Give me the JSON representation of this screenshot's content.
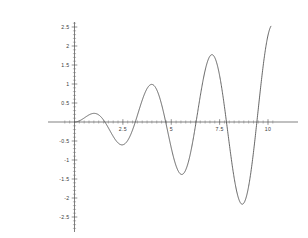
{
  "chart_data": {
    "type": "line",
    "title": "",
    "subtitle": "",
    "xlabel": "",
    "ylabel": "",
    "xlim": [
      -0.72,
      10.3
    ],
    "ylim": [
      -2.82,
      2.78
    ],
    "grid": false,
    "legend": false,
    "legend_position": "none",
    "axis_style": "centered-cross",
    "x_ticks_major": [
      2.5,
      5,
      7.5,
      10
    ],
    "x_tick_labels": [
      "2.5",
      "5",
      "7.5",
      "10"
    ],
    "y_ticks_major": [
      -2.5,
      -2,
      -1.5,
      -1,
      -0.5,
      0.5,
      1,
      1.5,
      2,
      2.5
    ],
    "y_tick_labels": [
      "-2.5",
      "-2",
      "-1.5",
      "-1",
      "-0.5",
      "0.5",
      "1",
      "1.5",
      "2",
      "2.5"
    ],
    "x_minor_tick_step": 0.25,
    "y_minor_tick_step": 0.1,
    "series": [
      {
        "name": "f(x) = (x/4)·sin(2x)",
        "color": "#4c4c4c",
        "x_start": 0,
        "x_end": 10.15,
        "zeros": [
          0,
          1.571,
          3.142,
          4.712,
          6.283,
          7.854,
          9.425
        ],
        "extrema": [
          {
            "x": 0.85,
            "y": 0.25,
            "kind": "max"
          },
          {
            "x": 2.32,
            "y": -0.61,
            "kind": "min"
          },
          {
            "x": 3.89,
            "y": 0.96,
            "kind": "max"
          },
          {
            "x": 5.47,
            "y": -1.42,
            "kind": "min"
          },
          {
            "x": 7.05,
            "y": 1.7,
            "kind": "max"
          },
          {
            "x": 8.62,
            "y": -2.23,
            "kind": "min"
          }
        ],
        "endpoint": {
          "x": 10.15,
          "y": 2.2
        },
        "x": [
          0,
          0.2,
          0.4,
          0.6,
          0.8,
          1,
          1.2,
          1.4,
          1.6,
          1.8,
          2,
          2.2,
          2.4,
          2.6,
          2.8,
          3,
          3.2,
          3.4,
          3.6,
          3.8,
          4,
          4.2,
          4.4,
          4.6,
          4.8,
          5,
          5.2,
          5.4,
          5.6,
          5.8,
          6,
          6.2,
          6.4,
          6.6,
          6.8,
          7,
          7.2,
          7.4,
          7.6,
          7.8,
          8,
          8.2,
          8.4,
          8.6,
          8.8,
          9,
          9.2,
          9.4,
          9.6,
          9.8,
          10,
          10.15
        ],
        "y": [
          0,
          0.019,
          0.072,
          0.14,
          0.2,
          0.227,
          0.217,
          0.17,
          0.093,
          0,
          -0.094,
          -0.174,
          -0.228,
          -0.248,
          -0.229,
          -0.175,
          -0.093,
          0.006,
          0.11,
          0.205,
          0.278,
          0.319,
          0.324,
          0.292,
          0.226,
          0.136,
          0.032,
          -0.075,
          -0.173,
          -0.25,
          -0.298,
          -0.311,
          -0.288,
          -0.232,
          -0.149,
          -0.049,
          0.058,
          0.161,
          0.249,
          0.312,
          0.344,
          0.341,
          0.304,
          0.235,
          0.142,
          0.035,
          -0.077,
          -0.183,
          -0.273,
          -0.338,
          -0.373,
          0.0
        ]
      }
    ],
    "function_expression": "(x/4)*sin(2x)"
  },
  "accent_color": "#4c4c4c",
  "background_color": "#ffffff",
  "axis_color": "#4a4a4a",
  "label_color": "#3a3a3a"
}
